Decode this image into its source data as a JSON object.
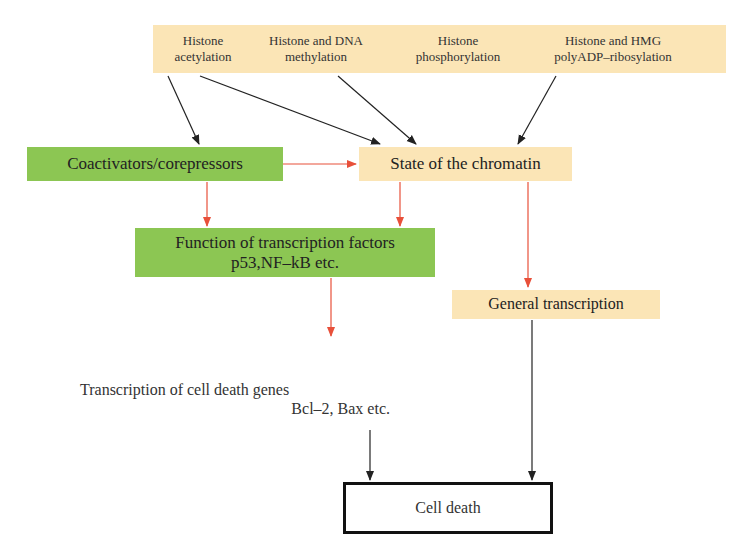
{
  "diagram": {
    "top_modifications": [
      {
        "line1": "Histone",
        "line2": "acetylation"
      },
      {
        "line1": "Histone and DNA",
        "line2": "methylation"
      },
      {
        "line1": "Histone",
        "line2": "phosphorylation"
      },
      {
        "line1": "Histone and HMG",
        "line2": "polyADP–ribosylation"
      }
    ],
    "coactivators": "Coactivators/corepressors",
    "chromatin_state": "State of the chromatin",
    "transcription_factors": {
      "line1": "Function of transcription factors",
      "line2": "p53,NF–kB etc."
    },
    "general_transcription": "General transcription",
    "cell_death_genes": {
      "line1": "Transcription of cell death genes",
      "line2": "Bcl–2, Bax etc."
    },
    "cell_death": "Cell death",
    "colors": {
      "tan_box": "#fbe5b6",
      "green_box": "#8cc653",
      "black_arrow": "#222222",
      "red_arrow": "#e8503a"
    }
  }
}
